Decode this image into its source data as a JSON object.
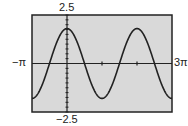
{
  "chart_data": {
    "type": "line",
    "title": "",
    "xlabel": "",
    "ylabel": "",
    "function_hint": "approximately 1.8·cos(x)",
    "xlim": [
      "-π",
      "3π"
    ],
    "ylim": [
      -2.5,
      2.5
    ],
    "x_window_labels": {
      "min": "−π",
      "max": "3π"
    },
    "y_window_labels": {
      "max": "2.5",
      "min": "−2.5"
    },
    "x_ticks": [
      "π",
      "2π"
    ],
    "y_tick_step": 0.25,
    "grid": false,
    "series": [
      {
        "name": "curve",
        "x": [
          "-π",
          "-π/2",
          "0",
          "π/2",
          "π",
          "3π/2",
          "2π",
          "5π/2",
          "3π"
        ],
        "values": [
          -1.8,
          0,
          1.8,
          0,
          -1.8,
          0,
          1.8,
          0,
          -1.8
        ]
      }
    ],
    "colors": {
      "plot_background": "#d9d9d9",
      "frame": "#222222",
      "curve": "#222222",
      "axes": "#222222"
    }
  }
}
